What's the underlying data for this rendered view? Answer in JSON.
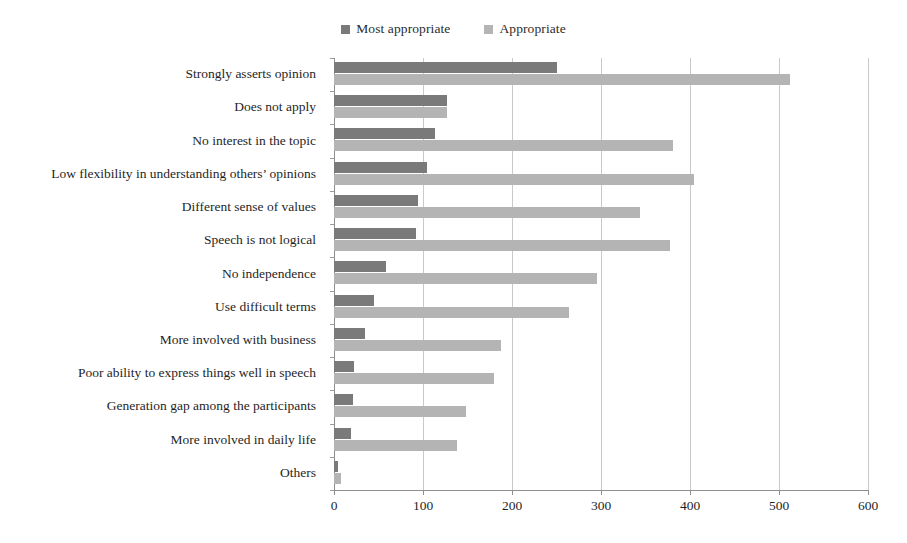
{
  "chart_data": {
    "type": "bar",
    "orientation": "horizontal",
    "title": "",
    "subtitle": "",
    "xlabel": "",
    "ylabel": "",
    "xlim": [
      0,
      600
    ],
    "xticks": [
      0,
      100,
      200,
      300,
      400,
      500,
      600
    ],
    "xtick_labels": [
      "0",
      "100",
      "200",
      "300",
      "400",
      "500",
      "600"
    ],
    "grid": true,
    "grid_axis": "x",
    "legend_position": "top-center",
    "categories": [
      "Strongly asserts opinion",
      "Does not apply",
      "No interest in the topic",
      "Low flexibility in understanding others’ opinions",
      "Different sense of values",
      "Speech is not logical",
      "No independence",
      "Use difficult terms",
      "More involved with business",
      "Poor ability to express things well in speech",
      "Generation gap among the participants",
      "More involved in daily life",
      "Others"
    ],
    "series": [
      {
        "name": "Most appropriate",
        "color": "#7a7a7a",
        "values": [
          250,
          127,
          113,
          105,
          94,
          92,
          58,
          45,
          35,
          22,
          21,
          19,
          5
        ]
      },
      {
        "name": "Appropriate",
        "color": "#b4b4b4",
        "values": [
          512,
          127,
          381,
          404,
          344,
          378,
          296,
          264,
          188,
          180,
          148,
          138,
          8
        ]
      }
    ]
  },
  "legend": {
    "entries": [
      {
        "label": "Most appropriate",
        "color": "#7a7a7a"
      },
      {
        "label": "Appropriate",
        "color": "#b4b4b4"
      }
    ]
  }
}
